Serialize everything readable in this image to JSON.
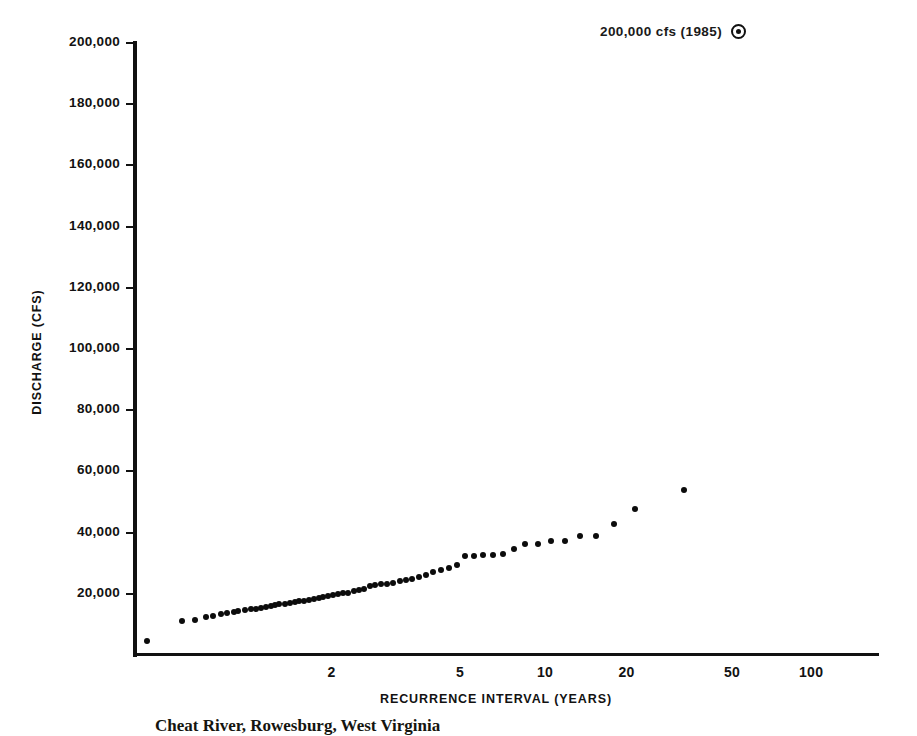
{
  "annotation": {
    "label": "200,000 cfs (1985)",
    "marker": "circled-dot-marker"
  },
  "caption": {
    "text": "Cheat River, Rowesburg, West Virginia"
  },
  "colors": {
    "axis": "#111111",
    "point": "#0c0c0c",
    "background": "#ffffff",
    "text": "#121212"
  },
  "chart_data": {
    "type": "scatter",
    "title": "",
    "subtitle": "",
    "xlabel": "RECURRENCE INTERVAL (YEARS)",
    "ylabel": "DISCHARGE (CFS)",
    "x_scale": "gumbel-probability",
    "x_ticks": [
      2,
      5,
      10,
      20,
      50,
      100
    ],
    "x_tick_labels": [
      "2",
      "5",
      "10",
      "20",
      "50",
      "100"
    ],
    "y_ticks": [
      20000,
      40000,
      60000,
      80000,
      100000,
      120000,
      140000,
      160000,
      180000,
      200000
    ],
    "y_tick_labels": [
      "20,000",
      "40,000",
      "60,000",
      "80,000",
      "100,000",
      "120,000",
      "140,000",
      "160,000",
      "180,000",
      "200,000"
    ],
    "ylim": [
      0,
      200000
    ],
    "xlim": [
      1.02,
      180
    ],
    "grid": false,
    "legend_position": "top-right",
    "legend_entries": [
      "200,000 cfs (1985)"
    ],
    "annotations": [
      {
        "text": "200,000 cfs (1985)",
        "marker": "circled-dot",
        "position": "outside-top-right",
        "value": 200000,
        "year": 1985
      }
    ],
    "series": [
      {
        "name": "Annual peak discharge",
        "marker": "filled-circle",
        "points": [
          {
            "x": 1.03,
            "y": 4500
          },
          {
            "x": 1.08,
            "y": 11000
          },
          {
            "x": 1.11,
            "y": 11500
          },
          {
            "x": 1.14,
            "y": 12400
          },
          {
            "x": 1.16,
            "y": 12700
          },
          {
            "x": 1.19,
            "y": 13400
          },
          {
            "x": 1.21,
            "y": 13600
          },
          {
            "x": 1.24,
            "y": 14200
          },
          {
            "x": 1.26,
            "y": 14300
          },
          {
            "x": 1.29,
            "y": 14600
          },
          {
            "x": 1.32,
            "y": 14900
          },
          {
            "x": 1.35,
            "y": 15100
          },
          {
            "x": 1.38,
            "y": 15300
          },
          {
            "x": 1.41,
            "y": 15800
          },
          {
            "x": 1.44,
            "y": 16100
          },
          {
            "x": 1.47,
            "y": 16200
          },
          {
            "x": 1.5,
            "y": 16600
          },
          {
            "x": 1.54,
            "y": 16800
          },
          {
            "x": 1.58,
            "y": 17000
          },
          {
            "x": 1.62,
            "y": 17300
          },
          {
            "x": 1.66,
            "y": 17600
          },
          {
            "x": 1.7,
            "y": 17800
          },
          {
            "x": 1.75,
            "y": 18000
          },
          {
            "x": 1.8,
            "y": 18300
          },
          {
            "x": 1.85,
            "y": 18500
          },
          {
            "x": 1.9,
            "y": 18800
          },
          {
            "x": 1.96,
            "y": 19200
          },
          {
            "x": 2.02,
            "y": 19500
          },
          {
            "x": 2.08,
            "y": 19800
          },
          {
            "x": 2.15,
            "y": 20100
          },
          {
            "x": 2.22,
            "y": 20400
          },
          {
            "x": 2.3,
            "y": 20800
          },
          {
            "x": 2.38,
            "y": 21100
          },
          {
            "x": 2.47,
            "y": 21500
          },
          {
            "x": 2.56,
            "y": 22600
          },
          {
            "x": 2.66,
            "y": 22900
          },
          {
            "x": 2.77,
            "y": 23100
          },
          {
            "x": 2.89,
            "y": 23300
          },
          {
            "x": 3.02,
            "y": 23600
          },
          {
            "x": 3.16,
            "y": 24200
          },
          {
            "x": 3.31,
            "y": 24500
          },
          {
            "x": 3.47,
            "y": 25000
          },
          {
            "x": 3.65,
            "y": 25600
          },
          {
            "x": 3.85,
            "y": 26300
          },
          {
            "x": 4.07,
            "y": 27000
          },
          {
            "x": 4.31,
            "y": 27800
          },
          {
            "x": 4.58,
            "y": 28300
          },
          {
            "x": 4.88,
            "y": 29400
          },
          {
            "x": 5.22,
            "y": 32200
          },
          {
            "x": 5.6,
            "y": 32400
          },
          {
            "x": 6.03,
            "y": 32600
          },
          {
            "x": 6.52,
            "y": 32800
          },
          {
            "x": 7.08,
            "y": 33000
          },
          {
            "x": 7.73,
            "y": 34800
          },
          {
            "x": 8.5,
            "y": 36300
          },
          {
            "x": 9.4,
            "y": 36200
          },
          {
            "x": 10.5,
            "y": 37200
          },
          {
            "x": 11.8,
            "y": 37400
          },
          {
            "x": 13.4,
            "y": 38800
          },
          {
            "x": 15.4,
            "y": 39000
          },
          {
            "x": 18.0,
            "y": 42800
          },
          {
            "x": 21.5,
            "y": 47800
          },
          {
            "x": 33.0,
            "y": 54000
          }
        ]
      }
    ]
  }
}
